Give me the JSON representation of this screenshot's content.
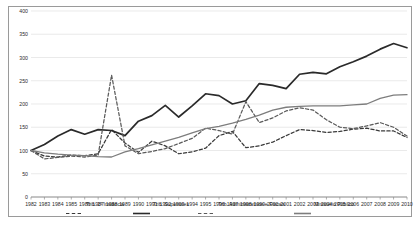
{
  "chart_data": {
    "type": "line",
    "title": "",
    "subtitle": "",
    "xlabel": "",
    "ylabel": "",
    "xlim": [
      1982,
      2010
    ],
    "ylim": [
      0,
      400
    ],
    "yticks": [
      0,
      50,
      100,
      150,
      200,
      250,
      300,
      350,
      400
    ],
    "ytick_labels": [
      "0",
      "50",
      "100",
      "150",
      "200",
      "250",
      "300",
      "350",
      "400"
    ],
    "grid": "horizontal",
    "legend_position": "bottom",
    "categories": [
      "1982",
      "1983",
      "1984",
      "1985",
      "1986",
      "1987",
      "1988",
      "1989",
      "1990",
      "1991",
      "1992",
      "1993",
      "1994",
      "1995",
      "1996",
      "1997",
      "1998",
      "1999",
      "2000",
      "2001",
      "2002",
      "2003",
      "2004",
      "2005",
      "2006",
      "2007",
      "2008",
      "2009",
      "2010"
    ],
    "x": [
      1982,
      1983,
      1984,
      1985,
      1986,
      1987,
      1988,
      1989,
      1990,
      1991,
      1992,
      1993,
      1994,
      1995,
      1996,
      1997,
      1998,
      1999,
      2000,
      2001,
      2002,
      2003,
      2004,
      2005,
      2006,
      2007,
      2008,
      2009,
      2010
    ],
    "series": [
      {
        "name": "Trib. 1ª Instância",
        "style": "dashed",
        "color": "#3a3a3a",
        "values": [
          100,
          88,
          86,
          90,
          89,
          93,
          145,
          116,
          96,
          120,
          110,
          93,
          97,
          105,
          132,
          141,
          106,
          110,
          118,
          132,
          145,
          143,
          139,
          141,
          146,
          148,
          142,
          142,
          128
        ]
      },
      {
        "name": "Trib. Superiores",
        "style": "solid",
        "color": "#2a2a2a",
        "values": [
          100,
          113,
          131,
          145,
          135,
          145,
          143,
          132,
          163,
          175,
          197,
          172,
          196,
          222,
          218,
          200,
          207,
          244,
          240,
          233,
          264,
          268,
          265,
          280,
          291,
          303,
          318,
          330,
          321
        ]
      },
      {
        "name": "Trib. Administrativos e Fiscais",
        "style": "dashed",
        "color": "#5a5a5a",
        "values": [
          100,
          82,
          85,
          88,
          86,
          90,
          262,
          110,
          93,
          98,
          104,
          115,
          126,
          148,
          143,
          135,
          205,
          160,
          170,
          185,
          192,
          187,
          166,
          150,
          147,
          153,
          160,
          150,
          131
        ]
      },
      {
        "name": "Ministério Público",
        "style": "solid",
        "color": "#7d7d7d",
        "values": [
          100,
          95,
          92,
          90,
          89,
          87,
          86,
          97,
          104,
          112,
          120,
          128,
          138,
          147,
          152,
          159,
          167,
          176,
          187,
          193,
          195,
          196,
          196,
          196,
          198,
          200,
          212,
          219,
          220
        ]
      }
    ]
  },
  "legend": {
    "items": [
      {
        "label": "Trib. 1ª Instância",
        "style": "dashed",
        "color": "#3a3a3a"
      },
      {
        "label": "Trib. Superiores",
        "style": "solid",
        "color": "#2a2a2a"
      },
      {
        "label": "Trib. Administrativos e Fiscais",
        "style": "dashed",
        "color": "#5a5a5a"
      },
      {
        "label": "Ministério Público",
        "style": "solid",
        "color": "#7d7d7d"
      }
    ]
  },
  "caption": {
    "text": ""
  },
  "colors": {
    "frame": "#9a9a9a",
    "gridline": "#dcdcdc",
    "axis": "#8c8c8c",
    "background": "#ffffff"
  }
}
